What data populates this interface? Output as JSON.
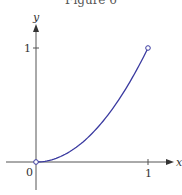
{
  "figure": {
    "title": "Figure 6"
  },
  "chart_data": {
    "type": "line",
    "title": "Figure 6",
    "xlabel": "x",
    "ylabel": "y",
    "xlim": [
      0,
      1
    ],
    "ylim": [
      0,
      1
    ],
    "x_ticks": [
      "0",
      "1"
    ],
    "y_ticks": [
      "1"
    ],
    "grid": false,
    "series": [
      {
        "name": "curve",
        "color": "#3a3aa0",
        "x": [
          0,
          0.1,
          0.2,
          0.3,
          0.4,
          0.5,
          0.6,
          0.7,
          0.8,
          0.9,
          1.0
        ],
        "y": [
          0,
          0.01,
          0.04,
          0.09,
          0.16,
          0.25,
          0.36,
          0.49,
          0.64,
          0.81,
          1.0
        ]
      }
    ],
    "annotations": [
      "open circle at (0,0)",
      "open circle at (1,1)"
    ]
  },
  "labels": {
    "x_axis": "x",
    "y_axis": "y",
    "origin": "0",
    "x_tick_1": "1",
    "y_tick_1": "1"
  }
}
